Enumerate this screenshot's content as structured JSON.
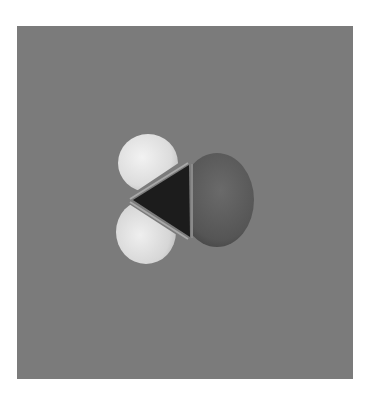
{
  "figure": {
    "alt": "Space-filling model of a molecule with two white hydrogen lobes, a dark central carbon wedge, and a larger oxygen sphere on a gray background",
    "background_color": "#7b7b7b",
    "page_color": "#ffffff",
    "frame": {
      "x": 17,
      "y": 26,
      "width": 336,
      "height": 353
    },
    "atoms": [
      {
        "name": "hydrogen-upper",
        "color": "#e6e6e6",
        "shade": "#bdbdbd",
        "cx": 131,
        "cy": 137,
        "rx": 30,
        "ry": 29
      },
      {
        "name": "hydrogen-lower",
        "color": "#e2e2e2",
        "shade": "#b5b5b5",
        "cx": 129,
        "cy": 206,
        "rx": 30,
        "ry": 32
      },
      {
        "name": "carbon",
        "color": "#1e1e1e",
        "points": "115,174 173,138 173,211"
      },
      {
        "name": "oxygen",
        "color": "#5a5a5a",
        "shade": "#3e3e3e",
        "cx": 205,
        "cy": 174,
        "rx": 31,
        "ry": 46
      }
    ]
  }
}
